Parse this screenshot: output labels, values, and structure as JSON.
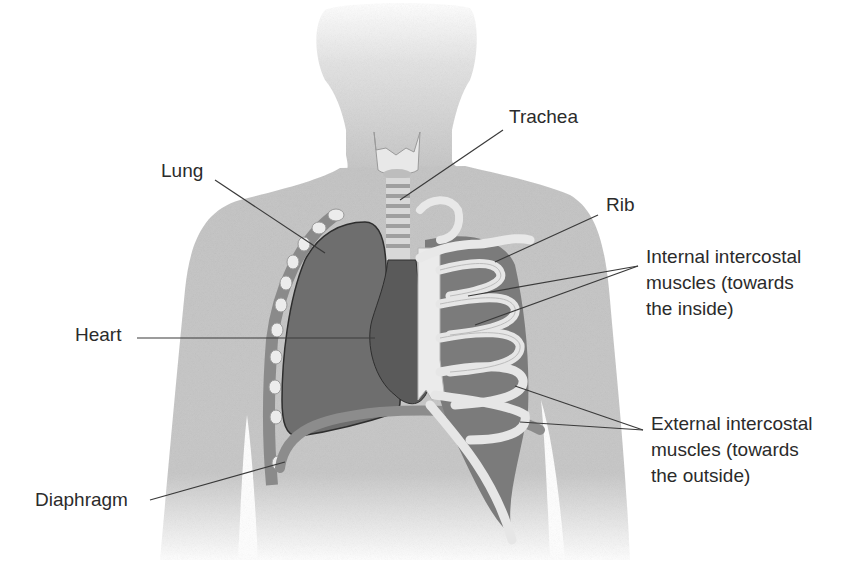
{
  "diagram": {
    "colors": {
      "background": "#ffffff",
      "body": "#c9c9c9",
      "head": "#e2e2e2",
      "lung": "#6e6e6e",
      "heart": "#5c5c5c",
      "bone": "#e6e6e6",
      "muscle": "#7a7a7a",
      "diaphragm": "#8c8c8c",
      "leader_line": "#3a3a3a",
      "text": "#2b2b2b"
    },
    "labels": [
      {
        "id": "trachea",
        "text": "Trachea"
      },
      {
        "id": "lung",
        "text": "Lung"
      },
      {
        "id": "rib",
        "text": "Rib"
      },
      {
        "id": "internal",
        "text": "Internal intercostal\nmuscles (towards\nthe inside)"
      },
      {
        "id": "heart",
        "text": "Heart"
      },
      {
        "id": "external",
        "text": "External intercostal\nmuscles (towards\nthe outside)"
      },
      {
        "id": "diaphragm",
        "text": "Diaphragm"
      }
    ]
  }
}
